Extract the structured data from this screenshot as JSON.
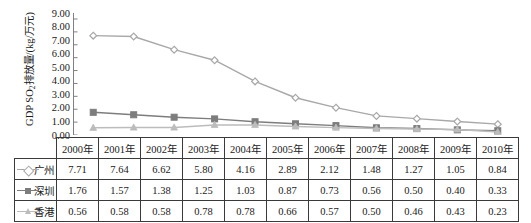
{
  "chart_data": {
    "type": "line",
    "title": "",
    "xlabel": "",
    "ylabel": "GDP SO2排放量/(kg/万元)",
    "ylabel_prefix": "GDP SO",
    "ylabel_sub": "2",
    "ylabel_suffix": "排放量/(kg/万元)",
    "ylim": [
      0.0,
      9.0
    ],
    "ytick_step": 1.0,
    "yticks": [
      "9.00",
      "8.00",
      "7.00",
      "6.00",
      "5.00",
      "4.00",
      "3.00",
      "2.00",
      "1.00",
      "0.00"
    ],
    "grid": false,
    "legend_position": "table-first-column",
    "categories": [
      "2000年",
      "2001年",
      "2002年",
      "2003年",
      "2004年",
      "2005年",
      "2006年",
      "2007年",
      "2008年",
      "2009年",
      "2010年"
    ],
    "series": [
      {
        "name": "广州",
        "marker": "diamond",
        "color": "#a8a8a8",
        "values": [
          7.71,
          7.64,
          6.62,
          5.8,
          4.16,
          2.89,
          2.12,
          1.48,
          1.27,
          1.05,
          0.84
        ]
      },
      {
        "name": "深圳",
        "marker": "square",
        "color": "#7d7d7d",
        "values": [
          1.76,
          1.57,
          1.38,
          1.25,
          1.03,
          0.87,
          0.73,
          0.56,
          0.5,
          0.4,
          0.33
        ]
      },
      {
        "name": "香港",
        "marker": "triangle",
        "color": "#bcbcbc",
        "values": [
          0.56,
          0.58,
          0.58,
          0.78,
          0.78,
          0.66,
          0.57,
          0.5,
          0.46,
          0.43,
          0.23
        ]
      }
    ]
  },
  "table": {
    "corner_label": "",
    "headers": [
      "2000年",
      "2001年",
      "2002年",
      "2003年",
      "2004年",
      "2005年",
      "2006年",
      "2007年",
      "2008年",
      "2009年",
      "2010年"
    ],
    "rows": [
      {
        "label": "广州",
        "values": [
          "7.71",
          "7.64",
          "6.62",
          "5.80",
          "4.16",
          "2.89",
          "2.12",
          "1.48",
          "1.27",
          "1.05",
          "0.84"
        ]
      },
      {
        "label": "深圳",
        "values": [
          "1.76",
          "1.57",
          "1.38",
          "1.25",
          "1.03",
          "0.87",
          "0.73",
          "0.56",
          "0.50",
          "0.40",
          "0.33"
        ]
      },
      {
        "label": "香港",
        "values": [
          "0.56",
          "0.58",
          "0.58",
          "0.78",
          "0.78",
          "0.66",
          "0.57",
          "0.50",
          "0.46",
          "0.43",
          "0.23"
        ]
      }
    ]
  },
  "colors": {
    "axis": "#808080",
    "border": "#3a3a3a",
    "text": "#1a1a1a",
    "background": "#ffffff"
  }
}
